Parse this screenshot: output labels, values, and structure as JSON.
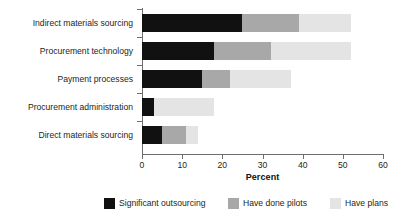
{
  "chart_data": {
    "type": "bar",
    "orientation": "horizontal",
    "stacked": true,
    "title": "",
    "xlabel": "Percent",
    "ylabel": "",
    "xlim": [
      0,
      60
    ],
    "xticks": [
      0,
      10,
      20,
      30,
      40,
      50,
      60
    ],
    "grid": false,
    "legend_position": "bottom",
    "categories": [
      "Indirect materials sourcing",
      "Procurement technology",
      "Payment processes",
      "Procurement administration",
      "Direct materials sourcing"
    ],
    "series": [
      {
        "name": "Significant outsourcing",
        "color": "#111111",
        "values": [
          25,
          18,
          15,
          3,
          5
        ]
      },
      {
        "name": "Have done pilots",
        "color": "#a8a8a8",
        "values": [
          14,
          14,
          7,
          0,
          6
        ]
      },
      {
        "name": "Have plans",
        "color": "#e4e4e4",
        "values": [
          13,
          20,
          15,
          15,
          3
        ]
      }
    ],
    "totals": [
      52,
      52,
      37,
      18,
      14
    ]
  },
  "axis": {
    "tick_labels": [
      "0",
      "10",
      "20",
      "30",
      "40",
      "50",
      "60"
    ],
    "title": "Percent"
  },
  "legend": {
    "items": [
      {
        "label": "Significant outsourcing",
        "color": "#111111"
      },
      {
        "label": "Have done pilots",
        "color": "#a8a8a8"
      },
      {
        "label": "Have plans",
        "color": "#e4e4e4"
      }
    ]
  },
  "colors": {
    "axis": "#6e6e6e",
    "text": "#231f20",
    "background": "#ffffff"
  }
}
